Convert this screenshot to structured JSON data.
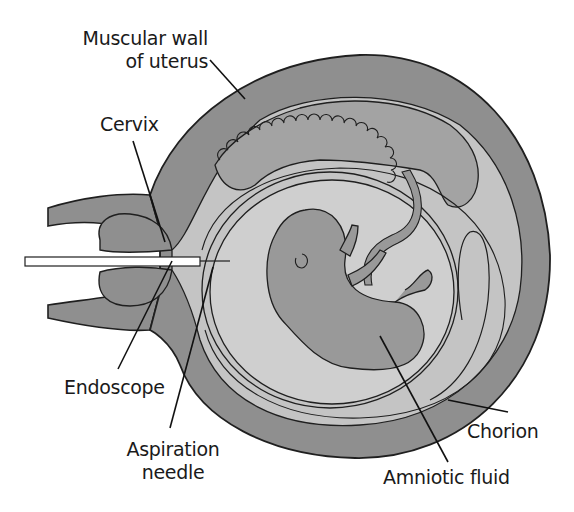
{
  "diagram": {
    "colors": {
      "muscle": "#8f8f8f",
      "cavity": "#c4c4c4",
      "placenta": "#a3a3a3",
      "amnion_fluid": "#cfcfcf",
      "fetus": "#999999",
      "outline": "#1f1f1f",
      "background": "#ffffff"
    },
    "labels": {
      "muscular_wall_line1": "Muscular wall",
      "muscular_wall_line2": "of uterus",
      "cervix": "Cervix",
      "endoscope": "Endoscope",
      "aspiration_line1": "Aspiration",
      "aspiration_line2": "needle",
      "chorion": "Chorion",
      "amniotic_fluid": "Amniotic fluid"
    }
  }
}
